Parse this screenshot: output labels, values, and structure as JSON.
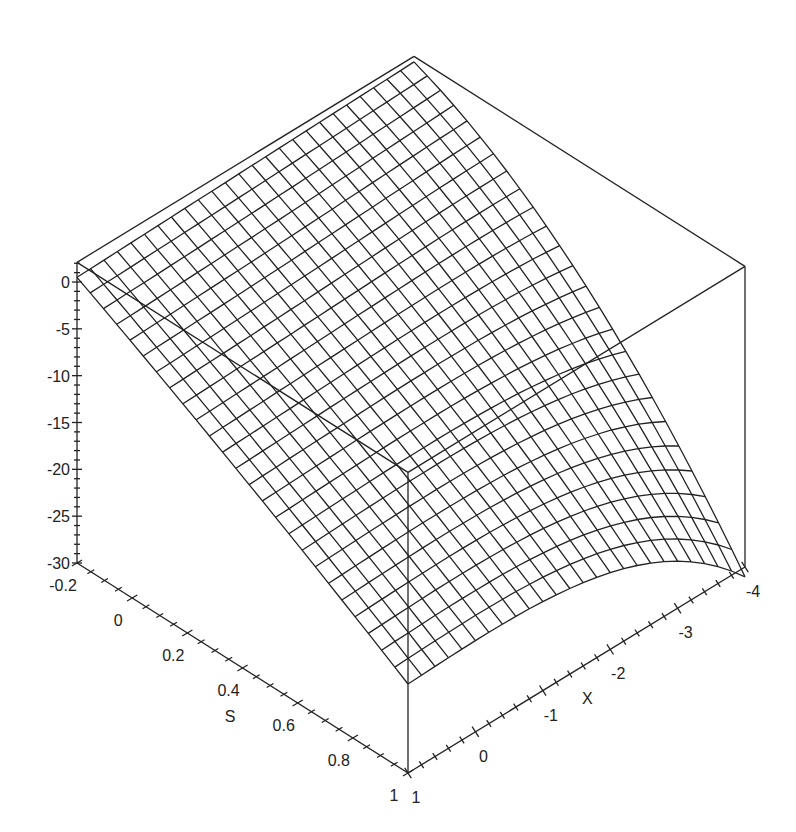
{
  "chart_data": {
    "type": "surface3d",
    "title": "",
    "xlabel": "X",
    "ylabel": "S",
    "zlabel": "",
    "x_range": [
      -4,
      1
    ],
    "s_range": [
      -0.2,
      1
    ],
    "z_range": [
      -30,
      2
    ],
    "x_ticks": [
      "1",
      "0",
      "-1",
      "-2",
      "-3",
      "-4"
    ],
    "s_ticks": [
      "-0.2",
      "0",
      "0.2",
      "0.4",
      "0.6",
      "0.8",
      "1"
    ],
    "z_ticks": [
      "0",
      "-5",
      "-10",
      "-15",
      "-20",
      "-25",
      "-30"
    ],
    "grid_resolution": [
      25,
      25
    ],
    "surface_corners": [
      {
        "x": -4,
        "s": -0.2,
        "z": 1.5,
        "note": "back peak"
      },
      {
        "x": 1,
        "s": -0.2,
        "z": 0.5
      },
      {
        "x": 1,
        "s": 1,
        "z": -20.5
      },
      {
        "x": -4,
        "s": 1,
        "z": -29.5
      }
    ],
    "style": "black wireframe mesh, boxed axes"
  },
  "colors": {
    "line": "#222222",
    "background": "#ffffff"
  }
}
